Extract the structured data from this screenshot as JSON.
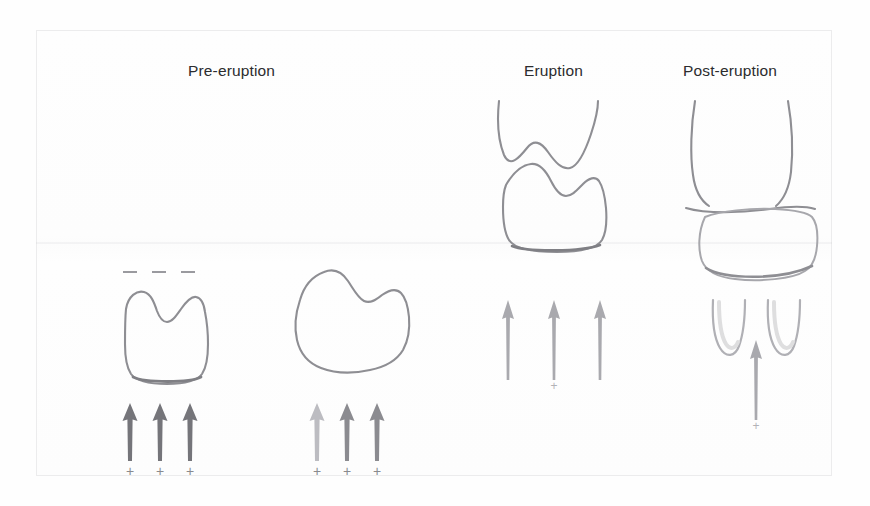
{
  "figure": {
    "title_columns": [
      {
        "id": "pre",
        "label": "Pre-eruption"
      },
      {
        "id": "erupt",
        "label": "Eruption"
      },
      {
        "id": "post",
        "label": "Post-eruption"
      }
    ],
    "background_color": "#fefefe",
    "outline_color": "#8e8e93",
    "arrow_colors": {
      "dark": "#75757a",
      "mid": "#8b8b90",
      "light": "#a9a9ae",
      "pale": "#bcbcc1"
    }
  },
  "stages": {
    "pre_eruption": {
      "label": "Pre-eruption",
      "panel_a": {
        "name": "unerupted-tooth-crown",
        "dash_marks": [
          "-",
          "-",
          "-"
        ],
        "dash_count": 3,
        "arrow_count": 3,
        "arrow_shade": "dark",
        "plus_signs": [
          "+",
          "+",
          "+"
        ],
        "plus_count": 3
      },
      "panel_b": {
        "name": "tilted-tooth-crown",
        "arrow_count": 3,
        "arrow_shade": "mid",
        "plus_signs": [
          "+",
          "+",
          "+"
        ],
        "plus_count": 3
      }
    },
    "eruption": {
      "label": "Eruption",
      "panel": {
        "name": "erupting-tooth-through-gingiva",
        "arrow_count": 3,
        "arrow_shade": "light",
        "plus_signs": [
          "+"
        ],
        "plus_count": 1
      }
    },
    "post_eruption": {
      "label": "Post-eruption",
      "panel": {
        "name": "erupted-tooth-with-roots",
        "root_count": 2,
        "arrow_count": 1,
        "arrow_shade": "light",
        "plus_signs": [
          "+"
        ],
        "plus_count": 1
      }
    }
  }
}
